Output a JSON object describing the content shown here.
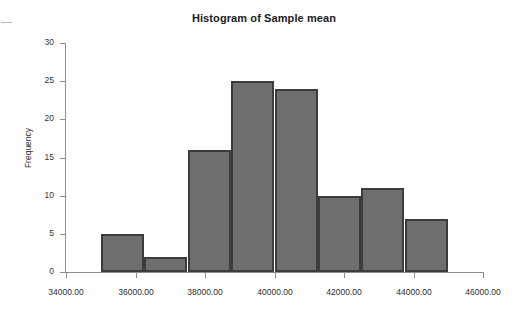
{
  "chart": {
    "title": "Histogram of Sample mean",
    "ylabel": "Frequency"
  },
  "axes": {
    "y_ticks": [
      "0",
      "5",
      "10",
      "15",
      "20",
      "25",
      "30"
    ],
    "x_ticks": [
      "34000.00",
      "36000.00",
      "38000.00",
      "40000.00",
      "42000.00",
      "44000.00",
      "46000.00"
    ]
  },
  "colors": {
    "bar_fill": "#6e6e6e",
    "bar_border": "#3c3c3c",
    "axis": "#8d8d8d",
    "text": "#2e2e2e",
    "background": "#ffffff"
  },
  "chart_data": {
    "type": "bar",
    "title": "Histogram of Sample mean",
    "xlabel": "",
    "ylabel": "Frequency",
    "xlim": [
      34000,
      46000
    ],
    "ylim": [
      0,
      30
    ],
    "grid": false,
    "legend": null,
    "bin_width": 1250,
    "bin_edges": [
      35000,
      36250,
      37500,
      38750,
      40000,
      41250,
      42500,
      43750,
      45000
    ],
    "categories": [
      "35000-36250",
      "36250-37500",
      "37500-38750",
      "38750-40000",
      "40000-41250",
      "41250-42500",
      "42500-43750",
      "43750-45000"
    ],
    "values": [
      5,
      2,
      16,
      25,
      24,
      10,
      11,
      7
    ],
    "xtick_values": [
      34000,
      36000,
      38000,
      40000,
      42000,
      44000,
      46000
    ],
    "xtick_labels": [
      "34000.00",
      "36000.00",
      "38000.00",
      "40000.00",
      "42000.00",
      "44000.00",
      "46000.00"
    ],
    "ytick_values": [
      0,
      5,
      10,
      15,
      20,
      25,
      30
    ],
    "ytick_labels": [
      "0",
      "5",
      "10",
      "15",
      "20",
      "25",
      "30"
    ]
  }
}
